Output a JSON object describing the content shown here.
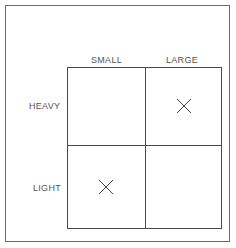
{
  "diagram": {
    "columns": [
      "SMALL",
      "LARGE"
    ],
    "rows": [
      "HEAVY",
      "LIGHT"
    ],
    "cells": [
      {
        "row": "HEAVY",
        "col": "SMALL",
        "mark": ""
      },
      {
        "row": "HEAVY",
        "col": "LARGE",
        "mark": "X"
      },
      {
        "row": "LIGHT",
        "col": "SMALL",
        "mark": "X"
      },
      {
        "row": "LIGHT",
        "col": "LARGE",
        "mark": ""
      }
    ],
    "line_color": "#4a4a4a",
    "text_color": "#555555"
  }
}
